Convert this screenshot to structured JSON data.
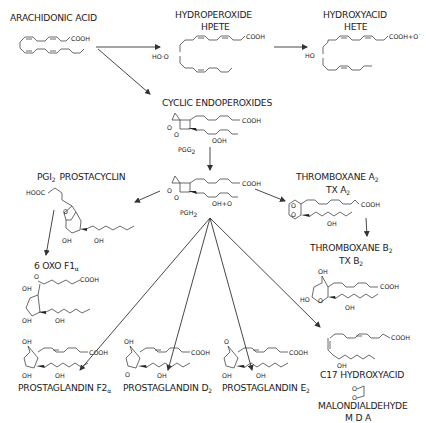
{
  "diagram": {
    "compounds": {
      "arachidonic_acid": {
        "name": "ARACHIDONIC ACID",
        "group": "COOH"
      },
      "hpete": {
        "name": "HYDROPEROXIDE",
        "abbr": "HPETE",
        "group": "COOH",
        "sub": "HO·O"
      },
      "hete": {
        "name": "HYDROXYACID",
        "abbr": "HETE",
        "group": "COOH+O˙",
        "sub": "HO"
      },
      "pgg2": {
        "name": "CYCLIC ENDOPEROXIDES",
        "abbr": "PGG",
        "abbr_sub": "2",
        "group": "COOH",
        "sub": "OOH",
        "ring_o1": "O",
        "ring_o2": "O"
      },
      "pgh2": {
        "abbr": "PGH",
        "abbr_sub": "2",
        "group": "COOH",
        "sub": "OH+O"
      },
      "pgi2": {
        "name_pre": "PGI",
        "name_sub": "2",
        "name_post": "PROSTACYCLIN",
        "group": "HOOC",
        "oh1": "OH",
        "oh2": "OH",
        "ring_o": "O"
      },
      "oxo_f1a": {
        "name": "6  OXO  F1",
        "name_sub": "α",
        "group": "COOH",
        "oxo": "O",
        "oh1": "OH",
        "oh2": "OH",
        "oh3": "OH"
      },
      "txa2": {
        "name_pre": "THROMBOXANE  A",
        "name_sub": "2",
        "abbr_pre": "TX  A",
        "abbr_sub": "2",
        "group": "COOH",
        "oh": "OH"
      },
      "txb2": {
        "name_pre": "THROMBOXANE  B",
        "name_sub": "2",
        "abbr_pre": "TX  B",
        "abbr_sub": "2",
        "group": "COOH",
        "oh1": "OH",
        "oh2": "HO",
        "oh3": "OH",
        "ring_o": "O"
      },
      "pgf2a": {
        "name_pre": "PROSTAGLANDIN  F2",
        "name_sub": "α",
        "group": "COOH",
        "oh1": "OH",
        "oh2": "OH",
        "oh3": "OH"
      },
      "pgd2": {
        "name_pre": "PROSTAGLANDIN  D",
        "name_sub": "2",
        "group": "COOH",
        "oh1": "OH",
        "oxo": "O",
        "oh2": "OH"
      },
      "pge2": {
        "name_pre": "PROSTAGLANDIN  E",
        "name_sub": "2",
        "group": "COOH",
        "oxo": "O",
        "oh1": "OH",
        "oh2": "OH"
      },
      "c17": {
        "name": "C17  HYDROXYACID",
        "group": "COOH",
        "oh": "OH"
      },
      "mda": {
        "name": "MALONDIALDEHYDE",
        "abbr": "M D A",
        "o1": "O",
        "o2": "O"
      }
    },
    "arrows": [
      {
        "from": "arachidonic_acid",
        "to": "hpete"
      },
      {
        "from": "arachidonic_acid",
        "to": "pgg2"
      },
      {
        "from": "hpete",
        "to": "hete"
      },
      {
        "from": "pgg2",
        "to": "pgh2"
      },
      {
        "from": "pgh2",
        "to": "pgi2"
      },
      {
        "from": "pgi2",
        "to": "oxo_f1a"
      },
      {
        "from": "pgh2",
        "to": "txa2"
      },
      {
        "from": "txa2",
        "to": "txb2"
      },
      {
        "from": "pgh2",
        "to": "pgf2a"
      },
      {
        "from": "pgh2",
        "to": "pgd2"
      },
      {
        "from": "pgh2",
        "to": "pge2"
      },
      {
        "from": "pgh2",
        "to": "c17"
      }
    ]
  }
}
